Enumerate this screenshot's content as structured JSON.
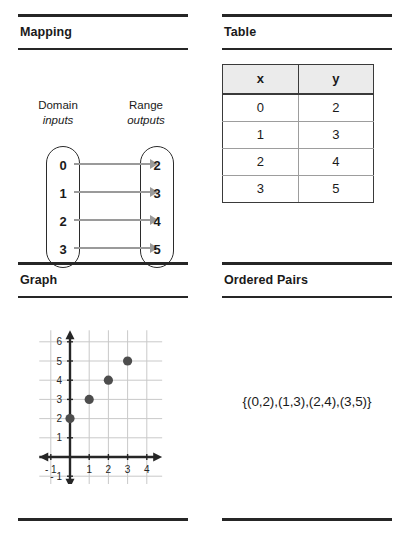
{
  "panels": {
    "mapping": {
      "title": "Mapping",
      "domain_label": "Domain",
      "domain_sub": "inputs",
      "range_label": "Range",
      "range_sub": "outputs",
      "domain_values": [
        "0",
        "1",
        "2",
        "3"
      ],
      "range_values": [
        "2",
        "3",
        "4",
        "5"
      ],
      "arrow_color": "#9a9a9a"
    },
    "table": {
      "title": "Table",
      "headers": [
        "x",
        "y"
      ],
      "rows": [
        [
          "0",
          "2"
        ],
        [
          "1",
          "3"
        ],
        [
          "2",
          "4"
        ],
        [
          "3",
          "5"
        ]
      ],
      "header_fill": "#ebebeb"
    },
    "graph": {
      "title": "Graph"
    },
    "ordered_pairs": {
      "title": "Ordered Pairs",
      "set_text": "{(0,2),(1,3),(2,4),(3,5)}"
    }
  },
  "chart_data": {
    "type": "scatter",
    "title": "Graph",
    "xlabel": "",
    "ylabel": "",
    "x": [
      0,
      1,
      2,
      3
    ],
    "y": [
      2,
      3,
      4,
      5
    ],
    "points": [
      {
        "x": 0,
        "y": 2,
        "label": "(0,2)"
      },
      {
        "x": 1,
        "y": 3,
        "label": "(1,3)"
      },
      {
        "x": 2,
        "y": 4,
        "label": "(2,4)"
      },
      {
        "x": 3,
        "y": 5,
        "label": "(3,5)"
      }
    ],
    "xlim": [
      -1.6,
      4.8
    ],
    "ylim": [
      -1.6,
      6.6
    ],
    "x_ticks": [
      -1,
      1,
      2,
      3,
      4
    ],
    "x_tick_labels": [
      "- 1",
      "1",
      "2",
      "3",
      "4"
    ],
    "y_ticks": [
      -1,
      1,
      2,
      3,
      4,
      5,
      6
    ],
    "y_tick_labels": [
      "- 1",
      "1",
      "2",
      "3",
      "4",
      "5",
      "6"
    ],
    "grid": true,
    "grid_color": "#c9c9c9",
    "axis_color": "#262626",
    "point_color": "#4d4d4d",
    "legend": null
  }
}
